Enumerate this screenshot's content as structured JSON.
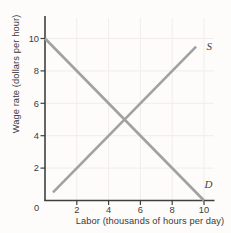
{
  "chart_data": {
    "type": "line",
    "title": "",
    "xlabel": "Labor (thousands of hours per day)",
    "ylabel": "Wage rate (dollars per hour)",
    "xlim": [
      0,
      10
    ],
    "ylim": [
      0,
      10
    ],
    "x_ticks": [
      2,
      4,
      6,
      8,
      10
    ],
    "y_ticks": [
      2,
      4,
      6,
      8,
      10
    ],
    "origin_label": "0",
    "grid": true,
    "series": [
      {
        "name": "supply",
        "label": "S",
        "points": [
          [
            0.5,
            0.5
          ],
          [
            9.5,
            9.5
          ]
        ]
      },
      {
        "name": "demand",
        "label": "D",
        "points": [
          [
            0,
            10
          ],
          [
            10,
            0
          ]
        ]
      }
    ],
    "series_label_positions": {
      "supply": [
        10.33,
        9.32
      ],
      "demand": [
        10.28,
        0.78
      ]
    }
  },
  "colors": {
    "curve": "#a1a1a1",
    "axis": "#3f3f3f",
    "grid": "#f0ede9",
    "text": "#3a3a3a",
    "background": "#fdfcfa"
  }
}
